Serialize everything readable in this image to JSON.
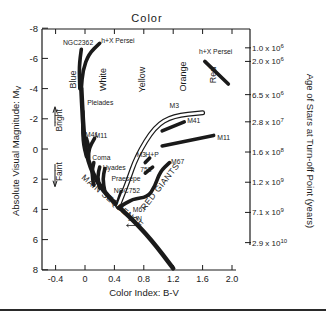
{
  "chart_data": {
    "type": "line",
    "title": "Color",
    "xlabel": "Color Index: B-V",
    "ylabel": "Absolute Visual Magnitude: M",
    "ylabel_subscript": "V",
    "y2label": "Age of Stars at Turn-off Point (years)",
    "xlim": [
      -0.6,
      2.2
    ],
    "ylim": [
      8,
      -8
    ],
    "x_ticks": [
      {
        "value": -0.4,
        "label": "-0.4"
      },
      {
        "value": 0,
        "label": "0"
      },
      {
        "value": 0.4,
        "label": "0.4"
      },
      {
        "value": 0.8,
        "label": "0.8"
      },
      {
        "value": 1.2,
        "label": "1.2"
      },
      {
        "value": 1.6,
        "label": "1.6"
      },
      {
        "value": 2.0,
        "label": "2.0"
      }
    ],
    "y_ticks": [
      {
        "value": -8,
        "label": "-8"
      },
      {
        "value": -6,
        "label": "-6"
      },
      {
        "value": -4,
        "label": "-4"
      },
      {
        "value": -2,
        "label": "-2"
      },
      {
        "value": 0,
        "label": "0"
      },
      {
        "value": 2,
        "label": "2"
      },
      {
        "value": 4,
        "label": "4"
      },
      {
        "value": 6,
        "label": "6"
      },
      {
        "value": 8,
        "label": "8"
      }
    ],
    "age_ticks": [
      {
        "mv": -6.7,
        "mantissa": "1.0",
        "exp": "6"
      },
      {
        "mv": -5.8,
        "mantissa": "2.0",
        "exp": "6"
      },
      {
        "mv": -3.6,
        "mantissa": "6.5",
        "exp": "6"
      },
      {
        "mv": -1.8,
        "mantissa": "2.8",
        "exp": "7"
      },
      {
        "mv": 0.2,
        "mantissa": "1.6",
        "exp": "8"
      },
      {
        "mv": 2.2,
        "mantissa": "1.2",
        "exp": "9"
      },
      {
        "mv": 4.2,
        "mantissa": "7.1",
        "exp": "9"
      },
      {
        "mv": 6.2,
        "mantissa": "2.9",
        "exp": "10"
      }
    ],
    "color_bands": [
      {
        "label": "Blue",
        "x": -0.12,
        "mv": -4.6
      },
      {
        "label": "White",
        "x": 0.28,
        "mv": -4.6
      },
      {
        "label": "Yellow",
        "x": 0.82,
        "mv": -4.6
      },
      {
        "label": "Orange",
        "x": 1.38,
        "mv": -4.8
      },
      {
        "label": "Red",
        "x": 1.78,
        "mv": -4.9
      }
    ],
    "bright_faint": {
      "bright": "Bright",
      "faint": "Faint"
    },
    "series": [
      {
        "name": "Main Sequence",
        "label": "MAIN SEQUENCE",
        "points": [
          [
            -0.05,
            -4.0
          ],
          [
            -0.03,
            -2.0
          ],
          [
            0.0,
            0.0
          ],
          [
            0.1,
            1.6
          ],
          [
            0.25,
            2.8
          ],
          [
            0.45,
            3.8
          ],
          [
            0.65,
            4.7
          ],
          [
            0.9,
            6.0
          ],
          [
            1.2,
            7.9
          ]
        ]
      },
      {
        "name": "NGC2362",
        "label": "NGC2362",
        "points": [
          [
            -0.05,
            -6.6
          ],
          [
            -0.08,
            -5.5
          ],
          [
            -0.07,
            -4.0
          ]
        ]
      },
      {
        "name": "h+χ Persei (blue)",
        "label": "h+X Persei",
        "points": [
          [
            0.2,
            -7.0
          ],
          [
            0.05,
            -6.3
          ],
          [
            -0.03,
            -5.2
          ],
          [
            -0.05,
            -4.0
          ]
        ]
      },
      {
        "name": "h+χ Persei (red)",
        "label": "h+X Persei",
        "points": [
          [
            1.63,
            -5.8
          ],
          [
            1.95,
            -4.3
          ]
        ]
      },
      {
        "name": "Pleiades",
        "label": "Pleiades",
        "points": [
          [
            -0.03,
            -2.5
          ],
          [
            -0.03,
            -0.5
          ],
          [
            0.02,
            0.5
          ]
        ]
      },
      {
        "name": "M41",
        "label": "M41",
        "points": [
          [
            0.02,
            -0.7
          ],
          [
            0.06,
            0.0
          ]
        ]
      },
      {
        "name": "M11",
        "label": "M11",
        "points": [
          [
            0.13,
            -0.7
          ],
          [
            0.05,
            0.0
          ],
          [
            0.05,
            0.6
          ]
        ]
      },
      {
        "name": "Coma",
        "label": "Coma",
        "points": [
          [
            0.12,
            0.9
          ],
          [
            0.09,
            1.6
          ],
          [
            0.12,
            2.4
          ]
        ]
      },
      {
        "name": "Hyades",
        "label": "Hyades",
        "points": [
          [
            0.2,
            1.2
          ],
          [
            0.17,
            1.8
          ],
          [
            0.2,
            2.6
          ]
        ]
      },
      {
        "name": "Praesepe",
        "label": "Praesepe",
        "points": [
          [
            0.27,
            1.3
          ],
          [
            0.24,
            2.0
          ],
          [
            0.27,
            2.8
          ]
        ]
      },
      {
        "name": "NGC752",
        "label": "NGC752",
        "points": [
          [
            0.5,
            2.8
          ],
          [
            0.45,
            3.4
          ],
          [
            0.45,
            3.8
          ]
        ]
      },
      {
        "name": "M3 (subgiant)",
        "label": "M3",
        "points": [
          [
            0.45,
            3.8
          ],
          [
            0.58,
            2.2
          ],
          [
            0.7,
            0.5
          ],
          [
            0.95,
            -1.5
          ],
          [
            1.2,
            -2.2
          ],
          [
            1.6,
            -2.4
          ]
        ],
        "style": "double"
      },
      {
        "name": "M41 giants",
        "label": "M41",
        "points": [
          [
            1.05,
            -1.2
          ],
          [
            1.35,
            -1.8
          ]
        ]
      },
      {
        "name": "M11 giants",
        "label": "M11",
        "points": [
          [
            1.05,
            -0.2
          ],
          [
            1.75,
            -0.9
          ]
        ]
      },
      {
        "name": "H+P",
        "label": "H+P",
        "points": [
          [
            0.82,
            0.9
          ],
          [
            0.88,
            0.6
          ]
        ]
      },
      {
        "name": "752",
        "label": "752",
        "points": [
          [
            0.82,
            1.6
          ],
          [
            0.92,
            1.2
          ]
        ]
      },
      {
        "name": "M67",
        "label": "M67",
        "points": [
          [
            0.45,
            3.9
          ],
          [
            0.65,
            3.3
          ],
          [
            0.85,
            3.2
          ],
          [
            0.95,
            2.5
          ],
          [
            1.02,
            1.5
          ],
          [
            1.15,
            0.9
          ]
        ]
      }
    ],
    "annotations": [
      {
        "text": "NGC2362",
        "x": -0.3,
        "mv": -6.9
      },
      {
        "text": "h+X Persei",
        "x": 0.22,
        "mv": -7.0
      },
      {
        "text": "h+X Persei",
        "x": 1.55,
        "mv": -6.3
      },
      {
        "text": "Pleiades",
        "x": 0.03,
        "mv": -2.9
      },
      {
        "text": "M41",
        "x": 0.0,
        "mv": -0.8
      },
      {
        "text": "M11",
        "x": 0.13,
        "mv": -0.7
      },
      {
        "text": "Coma",
        "x": 0.1,
        "mv": 0.7
      },
      {
        "text": "Hyades",
        "x": 0.24,
        "mv": 1.4
      },
      {
        "text": "Praesepe",
        "x": 0.36,
        "mv": 2.1
      },
      {
        "text": "NGC752",
        "x": 0.39,
        "mv": 2.9
      },
      {
        "text": "M3",
        "x": 1.15,
        "mv": -2.7
      },
      {
        "text": "M41",
        "x": 1.39,
        "mv": -1.7
      },
      {
        "text": "M11",
        "x": 1.8,
        "mv": -0.6
      },
      {
        "text": "M3",
        "x": 0.7,
        "mv": 0.5
      },
      {
        "text": "H+P",
        "x": 0.82,
        "mv": 0.5
      },
      {
        "text": "752",
        "x": 0.75,
        "mv": 1.5
      },
      {
        "text": "M67",
        "x": 1.17,
        "mv": 1.0
      },
      {
        "text": "M67",
        "x": 0.65,
        "mv": 4.2
      },
      {
        "text": "SUN",
        "x": 0.58,
        "mv": 4.8
      },
      {
        "text": "RED GIANTS",
        "x": 1.05,
        "mv": 2.6
      },
      {
        "text": "MAIN SEQUENCE",
        "x": 0.35,
        "mv": 3.6
      }
    ]
  }
}
